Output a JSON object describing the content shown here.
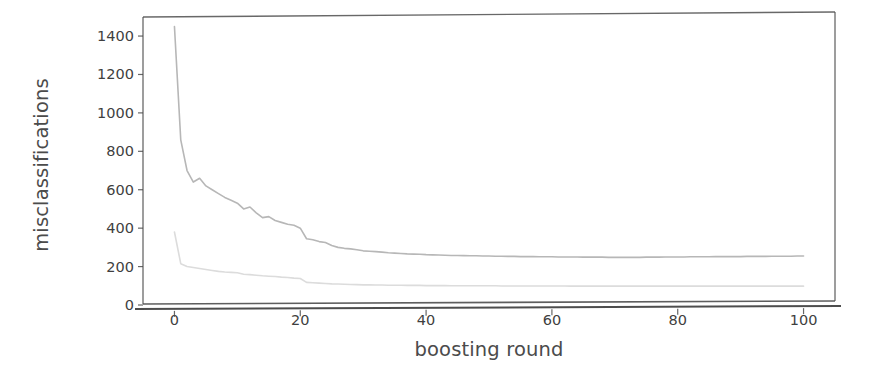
{
  "chart_data": {
    "type": "line",
    "title": "",
    "xlabel": "boosting round",
    "ylabel": "misclassifications",
    "xlim": [
      -5,
      105
    ],
    "ylim": [
      0,
      1520
    ],
    "grid": false,
    "legend": null,
    "xticks": [
      0,
      20,
      40,
      60,
      80,
      100
    ],
    "xtick_labels": [
      "0",
      "20",
      "40",
      "60",
      "80",
      "100"
    ],
    "yticks": [
      0,
      200,
      400,
      600,
      800,
      1000,
      1200,
      1400
    ],
    "ytick_labels": [
      "0",
      "200",
      "400",
      "600",
      "800",
      "1000",
      "1200",
      "1400"
    ],
    "colors": {
      "series_training": "#b7b7b7",
      "series_test": "#d9d9d9",
      "axis": "#4d4d4d",
      "background": "#ffffff"
    },
    "x": [
      0,
      1,
      2,
      3,
      4,
      5,
      6,
      7,
      8,
      9,
      10,
      11,
      12,
      13,
      14,
      15,
      16,
      17,
      18,
      19,
      20,
      21,
      22,
      23,
      24,
      25,
      26,
      27,
      28,
      29,
      30,
      31,
      32,
      33,
      34,
      35,
      36,
      37,
      38,
      39,
      40,
      41,
      42,
      43,
      44,
      45,
      46,
      47,
      48,
      49,
      50,
      51,
      52,
      53,
      54,
      55,
      56,
      57,
      58,
      59,
      60,
      61,
      62,
      63,
      64,
      65,
      66,
      67,
      68,
      69,
      70,
      71,
      72,
      73,
      74,
      75,
      76,
      77,
      78,
      79,
      80,
      81,
      82,
      83,
      84,
      85,
      86,
      87,
      88,
      89,
      90,
      91,
      92,
      93,
      94,
      95,
      96,
      97,
      98,
      99,
      100
    ],
    "series": [
      {
        "name": "upper-curve",
        "color": "#b7b7b7",
        "linewidth": 1.6,
        "values": [
          1450,
          860,
          700,
          640,
          660,
          620,
          600,
          580,
          560,
          545,
          530,
          500,
          510,
          480,
          455,
          460,
          440,
          430,
          420,
          415,
          400,
          345,
          340,
          330,
          325,
          310,
          300,
          295,
          292,
          288,
          282,
          280,
          278,
          275,
          272,
          270,
          268,
          266,
          265,
          264,
          262,
          261,
          260,
          259,
          258,
          258,
          257,
          256,
          256,
          255,
          255,
          254,
          254,
          253,
          253,
          252,
          252,
          252,
          251,
          251,
          251,
          250,
          250,
          250,
          250,
          249,
          249,
          249,
          249,
          248,
          248,
          248,
          248,
          248,
          248,
          249,
          249,
          249,
          250,
          250,
          250,
          250,
          251,
          251,
          251,
          251,
          252,
          252,
          252,
          252,
          252,
          253,
          253,
          253,
          253,
          254,
          254,
          254,
          254,
          255,
          255
        ]
      },
      {
        "name": "lower-curve",
        "color": "#dcdcdc",
        "linewidth": 1.6,
        "values": [
          380,
          215,
          200,
          195,
          190,
          185,
          180,
          175,
          172,
          170,
          168,
          160,
          158,
          155,
          152,
          150,
          148,
          145,
          143,
          140,
          138,
          118,
          116,
          114,
          112,
          110,
          109,
          108,
          107,
          106,
          105,
          105,
          104,
          104,
          103,
          103,
          103,
          102,
          102,
          102,
          101,
          101,
          101,
          101,
          100,
          100,
          100,
          100,
          100,
          100,
          100,
          100,
          99,
          99,
          99,
          99,
          99,
          99,
          99,
          99,
          99,
          99,
          99,
          98,
          98,
          98,
          98,
          98,
          98,
          98,
          98,
          98,
          98,
          98,
          98,
          98,
          98,
          98,
          98,
          98,
          98,
          98,
          98,
          98,
          98,
          98,
          98,
          98,
          98,
          98,
          98,
          98,
          98,
          98,
          98,
          98,
          98,
          98,
          98,
          98,
          98
        ]
      }
    ]
  }
}
